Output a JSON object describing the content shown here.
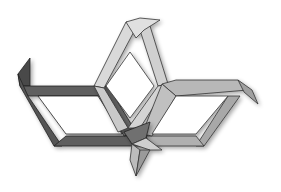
{
  "image": {
    "description": "Abstract 3D geometric figure of three interlocking rhombus frames with hooked ends",
    "width": 281,
    "height": 192,
    "background": "#ffffff"
  },
  "shapes": {
    "left_frame": {
      "label": "dark rhombus frame",
      "fill": "#5e5e5e",
      "fill_side": "#454545",
      "stroke": "#222222"
    },
    "top_frame": {
      "label": "light rhombus frame",
      "fill": "#d9d9d9",
      "fill_side": "#bdbdbd",
      "stroke": "#333333"
    },
    "right_frame": {
      "label": "medium rhombus frame",
      "fill": "#b3b3b3",
      "fill_side": "#969696",
      "stroke": "#333333"
    },
    "center_knot": {
      "label": "central interlock pieces",
      "fill": "#c8c8c8",
      "stroke": "#333333"
    }
  }
}
